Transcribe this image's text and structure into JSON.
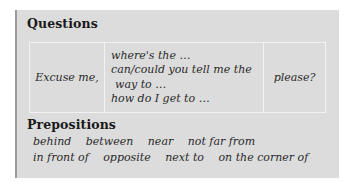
{
  "questions": {
    "heading": "Questions",
    "col1": "Excuse me,",
    "col2": [
      "where's the …",
      "can/could you tell me the",
      "way to …",
      "how do I get to …"
    ],
    "col3": "please?"
  },
  "prepositions": {
    "heading": "Prepositions",
    "rows": [
      [
        "behind",
        "between",
        "near",
        "not far from"
      ],
      [
        "in front of",
        "opposite",
        "next to",
        "on the corner of"
      ]
    ]
  },
  "colors": {
    "panel_bg": "#dcdcdc",
    "panel_border": "#9a9a9a",
    "table_lines": "#f2f2f2"
  }
}
